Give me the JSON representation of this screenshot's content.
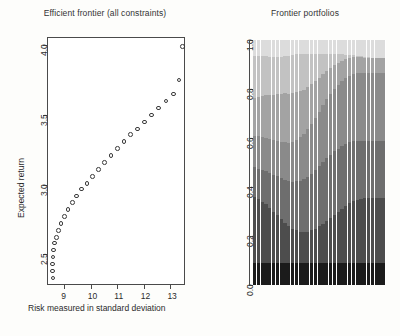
{
  "figure": {
    "background": "#fdfdfb",
    "panels": 2
  },
  "left_panel": {
    "title": "Efficient frontier (all constraints)",
    "xlabel": "Risk measured in standard deviation",
    "ylabel": "Expected return",
    "marker": "open-circle"
  },
  "right_panel": {
    "title": "Frontier portfolios",
    "xlabel": "",
    "ylabel": ""
  },
  "chart_data": [
    {
      "type": "scatter",
      "title": "Efficient frontier (all constraints)",
      "xlabel": "Risk measured in standard deviation",
      "ylabel": "Expected return",
      "xlim": [
        8.35,
        13.55
      ],
      "ylim": [
        2.28,
        4.06
      ],
      "xticks": [
        9,
        10,
        11,
        12,
        13
      ],
      "yticks": [
        2.5,
        3.0,
        3.5,
        4.0
      ],
      "xticklabels": [
        "9",
        "10",
        "11",
        "12",
        "13"
      ],
      "yticklabels": [
        "2.5",
        "3.0",
        "3.5",
        "4.0"
      ],
      "grid": false,
      "legend": false,
      "marker": "o",
      "series": [
        {
          "name": "Efficient frontier",
          "x": [
            8.58,
            8.56,
            8.56,
            8.57,
            8.6,
            8.64,
            8.7,
            8.78,
            8.88,
            9.0,
            9.14,
            9.3,
            9.47,
            9.66,
            9.86,
            10.07,
            10.29,
            10.52,
            10.76,
            11.0,
            11.25,
            11.5,
            11.76,
            12.02,
            12.29,
            12.56,
            12.83,
            13.11,
            13.33,
            13.46
          ],
          "y": [
            2.33,
            2.38,
            2.43,
            2.48,
            2.53,
            2.58,
            2.62,
            2.67,
            2.72,
            2.77,
            2.82,
            2.87,
            2.92,
            2.97,
            3.01,
            3.06,
            3.11,
            3.16,
            3.21,
            3.26,
            3.31,
            3.36,
            3.4,
            3.45,
            3.5,
            3.55,
            3.6,
            3.65,
            3.75,
            3.99
          ]
        }
      ]
    },
    {
      "type": "area",
      "title": "Frontier portfolios",
      "xlabel": "",
      "ylabel": "",
      "ylim": [
        0,
        1
      ],
      "yticks": [
        0.0,
        0.2,
        0.4,
        0.6,
        0.8,
        1.0
      ],
      "yticklabels": [
        "0.0",
        "0.2",
        "0.4",
        "0.6",
        "0.8",
        "1.0"
      ],
      "grid": false,
      "legend": false,
      "n_portfolios": 35,
      "stacked": true,
      "asset_colors": [
        "#1b1b1b",
        "#4d4d4d",
        "#6e6e6e",
        "#8a8a8a",
        "#a3a3a3",
        "#c2c2c2",
        "#dcdcdc"
      ],
      "asset_names": [
        "Asset 1",
        "Asset 2",
        "Asset 3",
        "Asset 4",
        "Asset 5",
        "Asset 6",
        "Asset 7"
      ],
      "series": [
        {
          "name": "Asset 1",
          "values": [
            0.09,
            0.09,
            0.09,
            0.09,
            0.09,
            0.09,
            0.09,
            0.09,
            0.09,
            0.09,
            0.09,
            0.09,
            0.09,
            0.09,
            0.09,
            0.09,
            0.09,
            0.09,
            0.09,
            0.09,
            0.09,
            0.09,
            0.09,
            0.09,
            0.09,
            0.09,
            0.09,
            0.09,
            0.09,
            0.09,
            0.09,
            0.09,
            0.09,
            0.09,
            0.09
          ]
        },
        {
          "name": "Asset 2",
          "values": [
            0.27,
            0.26,
            0.25,
            0.24,
            0.225,
            0.21,
            0.195,
            0.18,
            0.165,
            0.15,
            0.14,
            0.133,
            0.128,
            0.126,
            0.128,
            0.133,
            0.14,
            0.15,
            0.16,
            0.172,
            0.184,
            0.196,
            0.208,
            0.22,
            0.232,
            0.244,
            0.252,
            0.258,
            0.262,
            0.264,
            0.265,
            0.266,
            0.266,
            0.267,
            0.267
          ]
        },
        {
          "name": "Asset 3",
          "values": [
            0.12,
            0.125,
            0.13,
            0.136,
            0.143,
            0.15,
            0.158,
            0.166,
            0.175,
            0.184,
            0.192,
            0.2,
            0.208,
            0.216,
            0.224,
            0.232,
            0.24,
            0.246,
            0.252,
            0.256,
            0.258,
            0.259,
            0.258,
            0.256,
            0.252,
            0.248,
            0.244,
            0.24,
            0.237,
            0.235,
            0.234,
            0.233,
            0.233,
            0.232,
            0.232
          ]
        },
        {
          "name": "Asset 4",
          "values": [
            0.13,
            0.132,
            0.134,
            0.136,
            0.138,
            0.141,
            0.144,
            0.148,
            0.152,
            0.157,
            0.163,
            0.17,
            0.178,
            0.186,
            0.195,
            0.204,
            0.213,
            0.222,
            0.231,
            0.24,
            0.248,
            0.255,
            0.261,
            0.266,
            0.27,
            0.273,
            0.275,
            0.276,
            0.277,
            0.277,
            0.278,
            0.278,
            0.278,
            0.278,
            0.278
          ]
        },
        {
          "name": "Asset 5",
          "values": [
            0.155,
            0.16,
            0.166,
            0.172,
            0.179,
            0.186,
            0.192,
            0.197,
            0.2,
            0.2,
            0.198,
            0.194,
            0.188,
            0.18,
            0.171,
            0.161,
            0.15,
            0.139,
            0.128,
            0.117,
            0.107,
            0.098,
            0.09,
            0.083,
            0.077,
            0.072,
            0.068,
            0.065,
            0.063,
            0.062,
            0.061,
            0.06,
            0.06,
            0.06,
            0.06
          ]
        },
        {
          "name": "Asset 6",
          "values": [
            0.17,
            0.168,
            0.165,
            0.161,
            0.157,
            0.152,
            0.15,
            0.15,
            0.152,
            0.155,
            0.157,
            0.155,
            0.15,
            0.144,
            0.134,
            0.122,
            0.108,
            0.094,
            0.08,
            0.066,
            0.054,
            0.043,
            0.034,
            0.026,
            0.019,
            0.013,
            0.009,
            0.006,
            0.004,
            0.002,
            0.001,
            0.0,
            0.0,
            0.0,
            0.0
          ]
        },
        {
          "name": "Asset 7",
          "values": [
            0.065,
            0.065,
            0.065,
            0.065,
            0.068,
            0.071,
            0.071,
            0.069,
            0.066,
            0.064,
            0.06,
            0.058,
            0.058,
            0.058,
            0.058,
            0.058,
            0.059,
            0.059,
            0.059,
            0.059,
            0.059,
            0.059,
            0.059,
            0.059,
            0.058,
            0.06,
            0.062,
            0.065,
            0.067,
            0.07,
            0.071,
            0.073,
            0.073,
            0.073,
            0.073
          ]
        }
      ]
    }
  ]
}
